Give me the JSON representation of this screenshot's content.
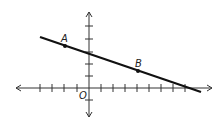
{
  "diagram": {
    "type": "coordinate-plane-line",
    "origin_label": "O",
    "points": [
      {
        "label": "A",
        "x": -2,
        "y": 3.5
      },
      {
        "label": "B",
        "x": 4,
        "y": 1.5
      }
    ],
    "line": {
      "from": [
        -4,
        4.2
      ],
      "to": [
        9,
        -0.1
      ]
    },
    "x_ticks": [
      -4,
      -3,
      -2,
      -1,
      1,
      2,
      3,
      4,
      5,
      6,
      7,
      8
    ],
    "y_ticks": [
      -1,
      1,
      2,
      3,
      4,
      5
    ],
    "colors": {
      "axis": "#333333",
      "line": "#111111"
    }
  }
}
